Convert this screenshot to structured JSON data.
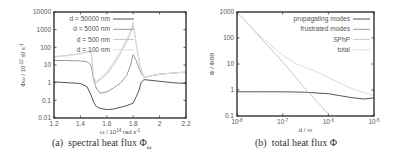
{
  "chart_data": [
    {
      "type": "line",
      "id": "a",
      "title": "",
      "caption": "(a)  spectral heat flux Φω",
      "caption_label": "(a)",
      "caption_text": "spectral heat flux Φ",
      "caption_sub": "ω",
      "xlabel": "ω / 10^14 rad s^-1",
      "ylabel": "Φω / 10^-12 W s^-1",
      "xscale": "linear",
      "yscale": "log",
      "xlim": [
        1.2,
        2.2
      ],
      "ylim": [
        0.01,
        10000
      ],
      "x_ticks": [
        "1.2",
        "1.4",
        "1.6",
        "1.8",
        "2",
        "2.2"
      ],
      "y_ticks": [
        "0.01",
        "0.1",
        "1",
        "10",
        "100",
        "1000",
        "10000"
      ],
      "legend_position": "upper left (inside)",
      "grid": false,
      "series": [
        {
          "name": "d = 50000 nm",
          "color": "#555555",
          "x": [
            1.2,
            1.3,
            1.4,
            1.45,
            1.48,
            1.5,
            1.52,
            1.55,
            1.6,
            1.65,
            1.7,
            1.75,
            1.8,
            1.84,
            1.86,
            1.88,
            2.0,
            2.1,
            2.2
          ],
          "y": [
            1.1,
            1.0,
            0.9,
            0.6,
            0.2,
            0.08,
            0.045,
            0.035,
            0.03,
            0.032,
            0.04,
            0.05,
            0.07,
            0.3,
            1.0,
            1.5,
            1.2,
            1.0,
            0.9
          ]
        },
        {
          "name": "d = 5000 nm",
          "color": "#9a9a9a",
          "x": [
            1.2,
            1.3,
            1.4,
            1.45,
            1.48,
            1.5,
            1.52,
            1.55,
            1.6,
            1.65,
            1.7,
            1.75,
            1.78,
            1.8,
            1.82,
            1.85,
            1.88,
            2.0,
            2.1,
            2.2
          ],
          "y": [
            18,
            18,
            17,
            15,
            10,
            1.5,
            0.5,
            0.25,
            0.3,
            0.5,
            0.9,
            2.5,
            10,
            40,
            20,
            5,
            2,
            3,
            3.5,
            4
          ]
        },
        {
          "name": "d = 500 nm",
          "color": "#c4c4c4",
          "x": [
            1.2,
            1.3,
            1.4,
            1.45,
            1.48,
            1.5,
            1.52,
            1.55,
            1.6,
            1.65,
            1.7,
            1.75,
            1.78,
            1.8,
            1.82,
            1.85,
            1.88,
            2.0,
            2.1,
            2.2
          ],
          "y": [
            30,
            35,
            45,
            55,
            60,
            2.0,
            1.0,
            1.5,
            3,
            10,
            40,
            200,
            600,
            2500,
            200,
            10,
            2,
            3,
            3.5,
            4
          ]
        },
        {
          "name": "d = 100 nm",
          "color": "#dedede",
          "x": [
            1.2,
            1.3,
            1.4,
            1.45,
            1.48,
            1.5,
            1.52,
            1.55,
            1.6,
            1.65,
            1.7,
            1.75,
            1.78,
            1.8,
            1.82,
            1.85,
            1.88,
            2.0,
            2.1,
            2.2
          ],
          "y": [
            28,
            33,
            42,
            52,
            58,
            2.0,
            1.2,
            1.8,
            4,
            14,
            60,
            300,
            900,
            2800,
            250,
            12,
            2,
            3,
            3.5,
            4
          ]
        }
      ]
    },
    {
      "type": "line",
      "id": "b",
      "title": "",
      "caption": "(b)  total heat flux Φ",
      "caption_label": "(b)",
      "caption_text": "total heat flux Φ",
      "xlabel": "d / m",
      "ylabel": "Φ / ΦBB",
      "xscale": "log",
      "yscale": "log",
      "xlim": [
        1e-08,
        1e-05
      ],
      "ylim": [
        0.1,
        1000
      ],
      "x_ticks": [
        "10^-8",
        "10^-7",
        "10^-6",
        "10^-5"
      ],
      "y_ticks": [
        "0.1",
        "1",
        "10",
        "100",
        "1000"
      ],
      "legend_position": "upper right (inside)",
      "grid": false,
      "series": [
        {
          "name": "propagating modes",
          "color": "#555555",
          "x": [
            1e-08,
            3e-08,
            1e-07,
            3e-07,
            1e-06,
            3e-06,
            6e-06,
            1e-05
          ],
          "y": [
            0.85,
            0.85,
            0.85,
            0.82,
            0.72,
            0.52,
            0.45,
            0.5
          ]
        },
        {
          "name": "frustrated modes",
          "color": "#9a9a9a",
          "x": [
            1e-08,
            1e-05
          ],
          "y": [
            null,
            null
          ]
        },
        {
          "name": "SPhP",
          "color": "#c8c8c8",
          "x": [
            1e-08,
            3e-08,
            1e-07,
            3e-07,
            1e-06
          ],
          "y": [
            1000,
            120,
            12,
            1.2,
            0.12
          ]
        },
        {
          "name": "total",
          "color": "#dcdcdc",
          "x": [
            1e-08,
            3e-08,
            1e-07,
            2e-07,
            5e-07,
            1e-06,
            3e-06,
            1e-05
          ],
          "y": [
            1000,
            130,
            22,
            10,
            5.5,
            3.0,
            1.2,
            0.6
          ]
        }
      ]
    }
  ]
}
